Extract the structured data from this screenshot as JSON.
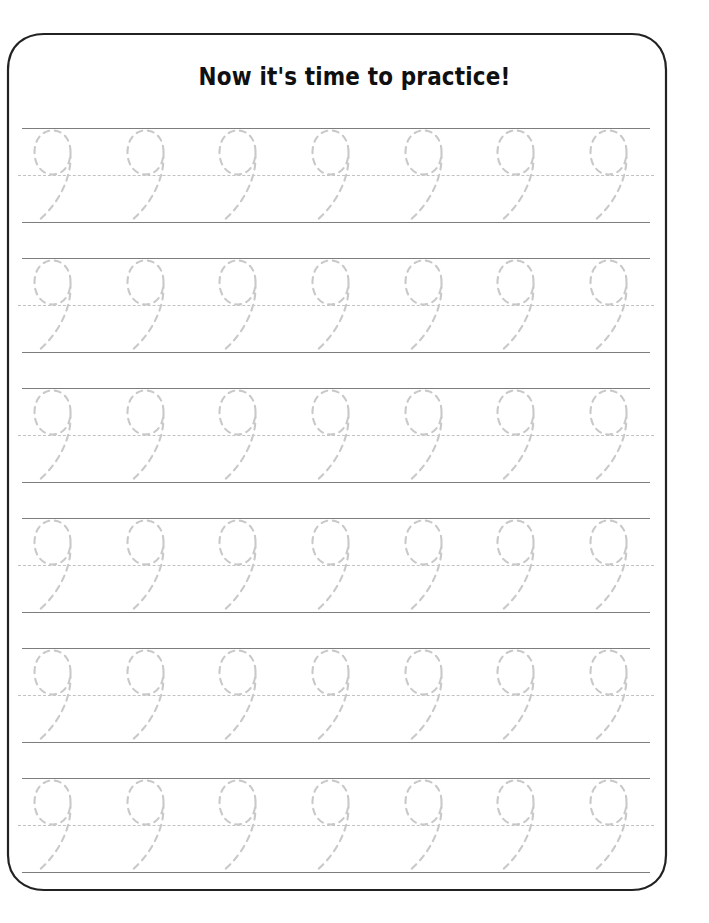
{
  "worksheet": {
    "title": "Now it's time to practice!",
    "trace_character": "9",
    "character_name": "nine",
    "rows": 6,
    "glyphs_per_row": 7,
    "total_glyphs": 42,
    "colors": {
      "page_background": "#ffffff",
      "title_text": "#101010",
      "frame_border": "#222222",
      "rule_line": "#7d7d7d",
      "midline_dash": "#c2c2c2",
      "trace_glyph": "#c9c9c9"
    },
    "frame": {
      "style": "concave-ogee-corners",
      "corners": [
        "top-left",
        "top-right",
        "bottom-left",
        "bottom-right"
      ]
    },
    "line_guides": {
      "top": "solid",
      "middle": "dashed",
      "bottom": "solid"
    },
    "practice_rows": [
      {
        "index": 1,
        "characters": [
          "9",
          "9",
          "9",
          "9",
          "9",
          "9",
          "9"
        ]
      },
      {
        "index": 2,
        "characters": [
          "9",
          "9",
          "9",
          "9",
          "9",
          "9",
          "9"
        ]
      },
      {
        "index": 3,
        "characters": [
          "9",
          "9",
          "9",
          "9",
          "9",
          "9",
          "9"
        ]
      },
      {
        "index": 4,
        "characters": [
          "9",
          "9",
          "9",
          "9",
          "9",
          "9",
          "9"
        ]
      },
      {
        "index": 5,
        "characters": [
          "9",
          "9",
          "9",
          "9",
          "9",
          "9",
          "9"
        ]
      },
      {
        "index": 6,
        "characters": [
          "9",
          "9",
          "9",
          "9",
          "9",
          "9",
          "9"
        ]
      }
    ]
  }
}
